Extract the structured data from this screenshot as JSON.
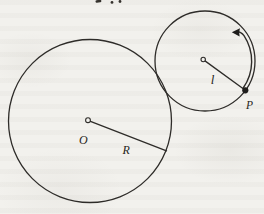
{
  "diagram": {
    "labels": {
      "big_circle_center": "O",
      "big_circle_radius": "R",
      "small_circle_radius": "l",
      "point_on_rim": "P"
    },
    "colors": {
      "paper": "#f2f1ed",
      "ink": "#2e2c29"
    }
  }
}
